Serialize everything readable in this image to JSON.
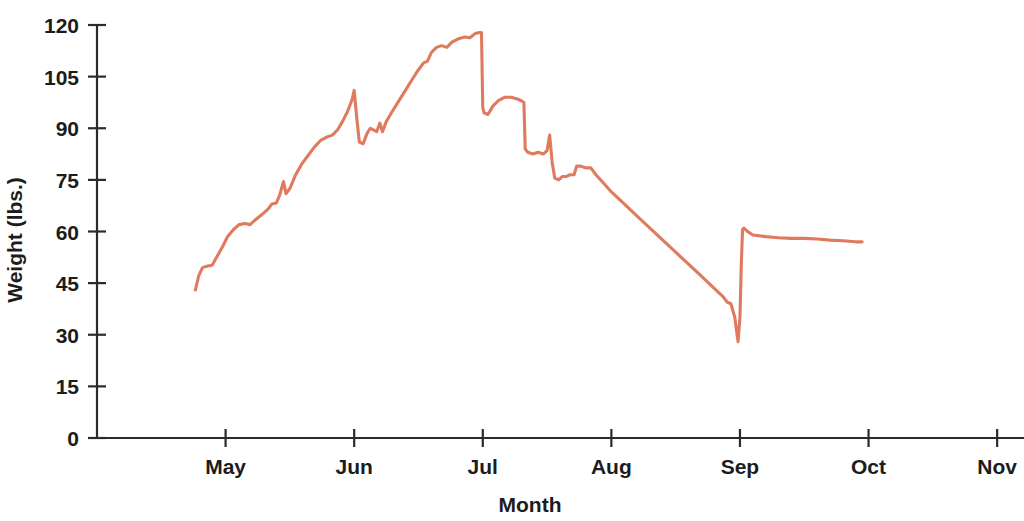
{
  "chart_data": {
    "type": "line",
    "title": "",
    "subtitle": "",
    "xlabel": "Month",
    "ylabel": "Weight (lbs.)",
    "grid": false,
    "legend": null,
    "legend_position": "none",
    "line_color": "#e07a5f",
    "axis_color": "#2b2b2b",
    "background_color": "#ffffff",
    "xlim": [
      0,
      7.1
    ],
    "ylim": [
      0,
      120
    ],
    "x_tick_labels": [
      "May",
      "Jun",
      "Jul",
      "Aug",
      "Sep",
      "Oct",
      "Nov"
    ],
    "x_tick_positions": [
      1,
      2,
      3,
      4,
      5,
      6,
      7
    ],
    "y_tick_labels": [
      "0",
      "15",
      "30",
      "45",
      "60",
      "75",
      "90",
      "105",
      "120"
    ],
    "y_tick_values": [
      0,
      15,
      30,
      45,
      60,
      75,
      90,
      105,
      120
    ],
    "series": [
      {
        "name": "Weight",
        "color": "#e07a5f",
        "points": [
          [
            0.765,
            43.0
          ],
          [
            0.79,
            47.0
          ],
          [
            0.82,
            49.5
          ],
          [
            0.86,
            50.0
          ],
          [
            0.895,
            50.2
          ],
          [
            0.93,
            52.5
          ],
          [
            0.975,
            55.5
          ],
          [
            1.015,
            58.5
          ],
          [
            1.06,
            60.5
          ],
          [
            1.105,
            62.0
          ],
          [
            1.15,
            62.3
          ],
          [
            1.19,
            62.0
          ],
          [
            1.235,
            63.5
          ],
          [
            1.285,
            65.0
          ],
          [
            1.33,
            66.5
          ],
          [
            1.36,
            68.0
          ],
          [
            1.395,
            68.3
          ],
          [
            1.42,
            70.5
          ],
          [
            1.45,
            74.5
          ],
          [
            1.47,
            71.0
          ],
          [
            1.5,
            72.5
          ],
          [
            1.545,
            76.5
          ],
          [
            1.59,
            79.5
          ],
          [
            1.64,
            82.0
          ],
          [
            1.69,
            84.5
          ],
          [
            1.74,
            86.5
          ],
          [
            1.79,
            87.5
          ],
          [
            1.83,
            88.0
          ],
          [
            1.87,
            89.5
          ],
          [
            1.91,
            92.0
          ],
          [
            1.95,
            95.0
          ],
          [
            1.985,
            98.5
          ],
          [
            2.0,
            101.0
          ],
          [
            2.02,
            93.0
          ],
          [
            2.04,
            86.0
          ],
          [
            2.07,
            85.5
          ],
          [
            2.1,
            88.5
          ],
          [
            2.125,
            90.0
          ],
          [
            2.15,
            89.5
          ],
          [
            2.175,
            89.0
          ],
          [
            2.2,
            91.5
          ],
          [
            2.22,
            89.0
          ],
          [
            2.25,
            92.0
          ],
          [
            2.29,
            94.5
          ],
          [
            2.34,
            97.5
          ],
          [
            2.39,
            100.5
          ],
          [
            2.44,
            103.5
          ],
          [
            2.49,
            106.5
          ],
          [
            2.54,
            109.0
          ],
          [
            2.57,
            109.5
          ],
          [
            2.6,
            112.0
          ],
          [
            2.64,
            113.5
          ],
          [
            2.68,
            114.0
          ],
          [
            2.72,
            113.5
          ],
          [
            2.76,
            115.0
          ],
          [
            2.81,
            116.0
          ],
          [
            2.86,
            116.5
          ],
          [
            2.9,
            116.3
          ],
          [
            2.94,
            117.5
          ],
          [
            2.975,
            117.8
          ],
          [
            2.99,
            117.8
          ],
          [
            3.0,
            96.0
          ],
          [
            3.01,
            94.5
          ],
          [
            3.04,
            94.0
          ],
          [
            3.08,
            96.5
          ],
          [
            3.12,
            98.0
          ],
          [
            3.17,
            99.0
          ],
          [
            3.22,
            99.0
          ],
          [
            3.27,
            98.5
          ],
          [
            3.3,
            98.0
          ],
          [
            3.32,
            97.5
          ],
          [
            3.33,
            84.0
          ],
          [
            3.35,
            83.0
          ],
          [
            3.39,
            82.5
          ],
          [
            3.43,
            83.0
          ],
          [
            3.47,
            82.5
          ],
          [
            3.5,
            83.5
          ],
          [
            3.52,
            88.0
          ],
          [
            3.54,
            80.0
          ],
          [
            3.56,
            75.5
          ],
          [
            3.59,
            75.0
          ],
          [
            3.62,
            76.0
          ],
          [
            3.65,
            76.0
          ],
          [
            3.68,
            76.5
          ],
          [
            3.71,
            76.5
          ],
          [
            3.73,
            79.0
          ],
          [
            3.76,
            79.0
          ],
          [
            3.8,
            78.5
          ],
          [
            3.84,
            78.5
          ],
          [
            3.88,
            76.5
          ],
          [
            3.94,
            74.0
          ],
          [
            4.0,
            71.5
          ],
          [
            4.1,
            68.0
          ],
          [
            4.2,
            64.5
          ],
          [
            4.3,
            61.0
          ],
          [
            4.4,
            57.5
          ],
          [
            4.5,
            54.0
          ],
          [
            4.6,
            50.5
          ],
          [
            4.7,
            47.0
          ],
          [
            4.8,
            43.5
          ],
          [
            4.87,
            41.0
          ],
          [
            4.9,
            39.5
          ],
          [
            4.93,
            39.0
          ],
          [
            4.96,
            35.0
          ],
          [
            4.985,
            28.0
          ],
          [
            5.0,
            35.0
          ],
          [
            5.01,
            50.0
          ],
          [
            5.02,
            60.5
          ],
          [
            5.03,
            61.0
          ],
          [
            5.06,
            60.0
          ],
          [
            5.1,
            59.0
          ],
          [
            5.2,
            58.5
          ],
          [
            5.3,
            58.2
          ],
          [
            5.4,
            58.0
          ],
          [
            5.5,
            58.0
          ],
          [
            5.6,
            57.8
          ],
          [
            5.7,
            57.5
          ],
          [
            5.8,
            57.3
          ],
          [
            5.9,
            57.0
          ],
          [
            5.95,
            57.0
          ]
        ]
      }
    ]
  }
}
